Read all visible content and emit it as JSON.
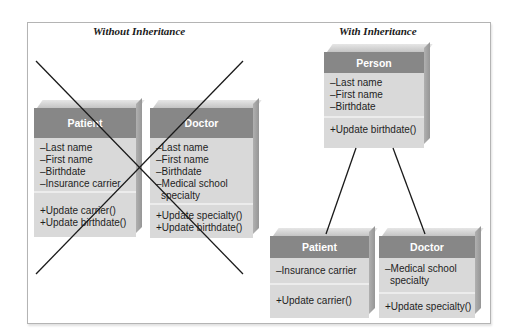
{
  "left_panel": {
    "title": "Without Inheritance",
    "crossed_out": true,
    "classes": [
      {
        "name": "Patient",
        "attributes": [
          "–Last name",
          "–First name",
          "–Birthdate",
          "–Insurance carrier"
        ],
        "methods": [
          "+Update carrier()",
          "+Update birthdate()"
        ]
      },
      {
        "name": "Doctor",
        "attributes": [
          "–Last name",
          "–First name",
          "–Birthdate",
          "–Medical school",
          "  specialty"
        ],
        "methods": [
          "+Update specialty()",
          "+Update birthdate()"
        ]
      }
    ]
  },
  "right_panel": {
    "title": "With Inheritance",
    "parent": {
      "name": "Person",
      "attributes": [
        "–Last name",
        "–First name",
        "–Birthdate"
      ],
      "methods": [
        "+Update birthdate()"
      ]
    },
    "children": [
      {
        "name": "Patient",
        "attributes": [
          "–Insurance carrier"
        ],
        "methods": [
          "+Update carrier()"
        ]
      },
      {
        "name": "Doctor",
        "attributes": [
          "–Medical school",
          "  specialty"
        ],
        "methods": [
          "+Update specialty()"
        ]
      }
    ]
  },
  "colors": {
    "header": "#878787",
    "body": "#d9d9d9",
    "line": "#1a1a1a",
    "frame": "#b4b4b4"
  }
}
